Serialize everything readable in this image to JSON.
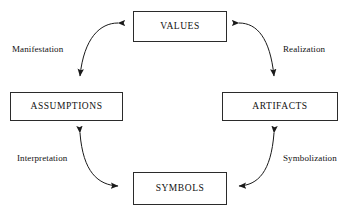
{
  "diagram": {
    "type": "cycle-diagram",
    "stroke_color": "#2b2b2b",
    "text_color": "#111111",
    "background_color": "#ffffff",
    "nodes": [
      {
        "id": "values",
        "label": "VALUES",
        "position": "top"
      },
      {
        "id": "assumptions",
        "label": "ASSUMPTIONS",
        "position": "left"
      },
      {
        "id": "artifacts",
        "label": "ARTIFACTS",
        "position": "right"
      },
      {
        "id": "symbols",
        "label": "SYMBOLS",
        "position": "bottom"
      }
    ],
    "edges": [
      {
        "id": "manifestation",
        "label": "Manifestation",
        "from": "values",
        "to": "assumptions",
        "arrowheads": "both",
        "side": "upper-left"
      },
      {
        "id": "realization",
        "label": "Realization",
        "from": "values",
        "to": "artifacts",
        "arrowheads": "both",
        "side": "upper-right"
      },
      {
        "id": "interpretation",
        "label": "Interpretation",
        "from": "symbols",
        "to": "assumptions",
        "arrowheads": "both",
        "side": "lower-left"
      },
      {
        "id": "symbolization",
        "label": "Symbolization",
        "from": "artifacts",
        "to": "symbols",
        "arrowheads": "both",
        "side": "lower-right"
      }
    ]
  }
}
